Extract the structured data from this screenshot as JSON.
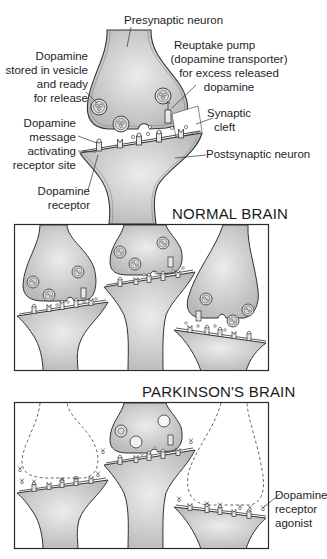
{
  "figure": {
    "top_diagram": {
      "labels": {
        "presynaptic_neuron": "Presynaptic neuron",
        "vesicle": [
          "Dopamine",
          "stored in vesicle",
          "and ready",
          "for release"
        ],
        "reuptake": [
          "Reuptake pump",
          "(dopamine transporter)",
          "for excess released",
          "dopamine"
        ],
        "synaptic_cleft": [
          "Synaptic",
          "cleft"
        ],
        "message": [
          "Dopamine",
          "message",
          "activating",
          "receptor site"
        ],
        "postsynaptic_neuron": "Postsynaptic neuron",
        "receptor": [
          "Dopamine",
          "receptor"
        ]
      }
    },
    "normal_panel": {
      "title": "NORMAL BRAIN"
    },
    "parkinsons_panel": {
      "title": "PARKINSON'S BRAIN",
      "labels": {
        "agonist": [
          "Dopamine",
          "receptor",
          "agonist"
        ]
      }
    },
    "colors": {
      "neuron_fill": "#c4c4c4",
      "neuron_fill_light": "#e6e6e6",
      "outline": "#3a3a3a",
      "text": "#1e1e1e",
      "frame": "#2a2a2a"
    }
  }
}
